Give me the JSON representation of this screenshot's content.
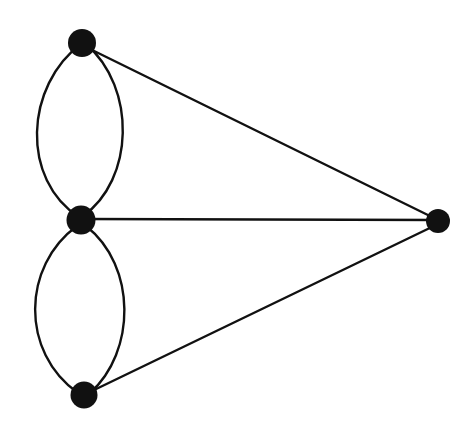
{
  "figure": {
    "kind": "graph-diagram",
    "background_color": "#ffffff",
    "ink_color": "#111111",
    "width": 474,
    "height": 423
  },
  "style": {
    "vertex_fill": "#111111",
    "edge_stroke": "#111111",
    "edge_width": 2.4,
    "arc_edge_width": 2.4
  },
  "graph": {
    "vertex_count": 4,
    "edge_count": 7,
    "vertices": [
      {
        "id": "v-top",
        "label": "top-left vertex",
        "cx": 82,
        "cy": 43,
        "r": 14
      },
      {
        "id": "v-middle",
        "label": "middle-left vertex",
        "cx": 81,
        "cy": 220,
        "r": 14.5
      },
      {
        "id": "v-bottom",
        "label": "bottom-left vertex",
        "cx": 84,
        "cy": 395,
        "r": 13.5
      },
      {
        "id": "v-right",
        "label": "right vertex",
        "cx": 438,
        "cy": 221,
        "r": 12
      }
    ],
    "edges": [
      {
        "id": "e-top-middle-left",
        "from": "v-top",
        "to": "v-middle",
        "shape": "arc",
        "bulge": "left",
        "path": "M 82 43 C 24 86 21 180 79 217"
      },
      {
        "id": "e-top-middle-right",
        "from": "v-top",
        "to": "v-middle",
        "shape": "arc",
        "bulge": "right",
        "path": "M 86 44 C 137 88 134 180 83 216"
      },
      {
        "id": "e-middle-bottom-left",
        "from": "v-middle",
        "to": "v-bottom",
        "shape": "arc",
        "bulge": "left",
        "path": "M 77 226 C 22 266 20 352 78 393"
      },
      {
        "id": "e-middle-bottom-right",
        "from": "v-middle",
        "to": "v-bottom",
        "shape": "arc",
        "bulge": "right",
        "path": "M 86 226 C 137 266 136 352 90 393"
      },
      {
        "id": "e-top-right",
        "from": "v-top",
        "to": "v-right",
        "shape": "straight",
        "path": "M 88 48 L 436 219"
      },
      {
        "id": "e-middle-right",
        "from": "v-middle",
        "to": "v-right",
        "shape": "straight",
        "path": "M 84 219 L 436 220"
      },
      {
        "id": "e-bottom-right",
        "from": "v-bottom",
        "to": "v-right",
        "shape": "straight",
        "path": "M 92 391 L 436 225"
      }
    ]
  }
}
